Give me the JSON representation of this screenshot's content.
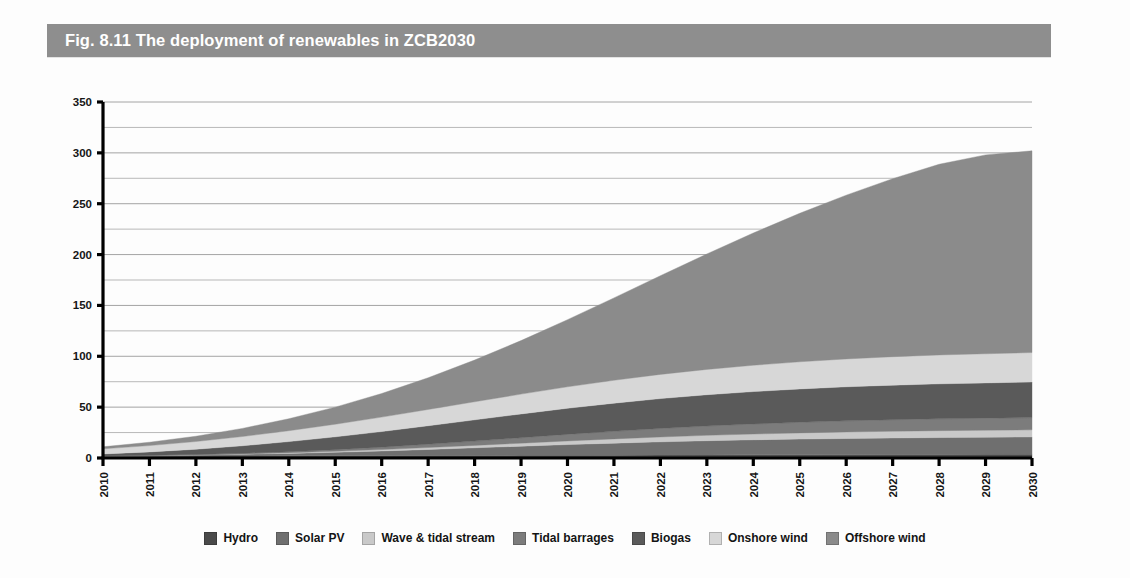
{
  "figure": {
    "title": "Fig. 8.11 The deployment of renewables in ZCB2030",
    "banner_color": "#8e8e8e",
    "background": "#fdfdfd"
  },
  "chart_data": {
    "type": "area",
    "stacked": true,
    "title": "Fig. 8.11 The deployment of renewables in ZCB2030",
    "xlabel": "",
    "ylabel": "",
    "ylim": [
      0,
      350
    ],
    "xlim": [
      2010,
      2030
    ],
    "ytick_step": 50,
    "gridline_step": 25,
    "grid": true,
    "legend_position": "bottom",
    "x": [
      2010,
      2011,
      2012,
      2013,
      2014,
      2015,
      2016,
      2017,
      2018,
      2019,
      2020,
      2021,
      2022,
      2023,
      2024,
      2025,
      2026,
      2027,
      2028,
      2029,
      2030
    ],
    "categories": [
      "2010",
      "2011",
      "2012",
      "2013",
      "2014",
      "2015",
      "2016",
      "2017",
      "2018",
      "2019",
      "2020",
      "2021",
      "2022",
      "2023",
      "2024",
      "2025",
      "2026",
      "2027",
      "2028",
      "2029",
      "2030"
    ],
    "ytick_labels": [
      "0",
      "50",
      "100",
      "150",
      "200",
      "250",
      "300",
      "350"
    ],
    "series": [
      {
        "name": "Hydro",
        "color": "#4a4a4a",
        "values": [
          1.7,
          1.8,
          1.9,
          2.0,
          2.1,
          2.2,
          2.3,
          2.4,
          2.5,
          2.6,
          2.7,
          2.8,
          2.9,
          3.0,
          3.1,
          3.2,
          3.3,
          3.4,
          3.5,
          3.6,
          3.7
        ]
      },
      {
        "name": "Solar PV",
        "color": "#6f6f6f",
        "values": [
          0.3,
          0.6,
          1.0,
          1.6,
          2.4,
          3.4,
          4.6,
          6.0,
          7.5,
          9.0,
          10.5,
          11.8,
          13.0,
          14.0,
          14.8,
          15.4,
          15.9,
          16.3,
          16.6,
          16.8,
          17.0
        ]
      },
      {
        "name": "Wave & tidal stream",
        "color": "#c9c9c9",
        "values": [
          0.0,
          0.1,
          0.2,
          0.4,
          0.7,
          1.0,
          1.4,
          1.9,
          2.4,
          3.0,
          3.6,
          4.2,
          4.8,
          5.3,
          5.7,
          6.1,
          6.4,
          6.6,
          6.8,
          6.9,
          7.0
        ]
      },
      {
        "name": "Tidal barrages",
        "color": "#7c7c7c",
        "values": [
          0.0,
          0.1,
          0.3,
          0.6,
          1.0,
          1.6,
          2.3,
          3.2,
          4.2,
          5.3,
          6.4,
          7.4,
          8.3,
          9.1,
          9.8,
          10.4,
          10.9,
          11.3,
          11.6,
          11.8,
          12.0
        ]
      },
      {
        "name": "Biogas",
        "color": "#5a5a5a",
        "values": [
          2.0,
          3.4,
          5.2,
          7.4,
          9.9,
          12.6,
          15.4,
          18.2,
          20.9,
          23.4,
          25.7,
          27.7,
          29.4,
          30.8,
          31.9,
          32.8,
          33.5,
          34.0,
          34.4,
          34.7,
          35.0
        ]
      },
      {
        "name": "Onshore wind",
        "color": "#d7d7d7",
        "values": [
          5.0,
          6.2,
          7.6,
          9.1,
          10.7,
          12.4,
          14.2,
          16.0,
          17.8,
          19.5,
          21.1,
          22.5,
          23.8,
          24.9,
          25.9,
          26.7,
          27.4,
          28.0,
          28.4,
          28.7,
          29.0
        ]
      },
      {
        "name": "Offshore wind",
        "color": "#8b8b8b",
        "values": [
          2.0,
          3.3,
          5.2,
          8.0,
          11.8,
          16.8,
          23.2,
          31.2,
          41.0,
          52.6,
          66.0,
          81.0,
          97.0,
          113.5,
          130.0,
          146.0,
          161.0,
          175.0,
          187.5,
          195.5,
          198.3
        ]
      }
    ],
    "totals_note": "Stacked total reaches approximately 302 in 2030",
    "totals": [
      11.0,
      15.5,
      21.4,
      29.1,
      38.6,
      50.0,
      63.4,
      78.9,
      96.3,
      115.4,
      136.0,
      157.4,
      179.2,
      200.6,
      221.2,
      240.6,
      258.4,
      274.6,
      288.8,
      298.0,
      302.0
    ]
  },
  "legend": {
    "items": [
      {
        "label": "Hydro",
        "color": "#4a4a4a"
      },
      {
        "label": "Solar PV",
        "color": "#6f6f6f"
      },
      {
        "label": "Wave & tidal stream",
        "color": "#c9c9c9"
      },
      {
        "label": "Tidal barrages",
        "color": "#7c7c7c"
      },
      {
        "label": "Biogas",
        "color": "#5a5a5a"
      },
      {
        "label": "Onshore wind",
        "color": "#d7d7d7"
      },
      {
        "label": "Offshore wind",
        "color": "#8b8b8b"
      }
    ]
  }
}
